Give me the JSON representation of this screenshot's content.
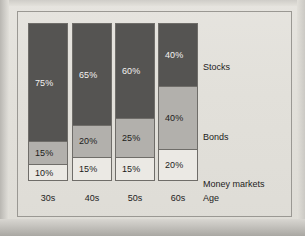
{
  "chart_data": {
    "type": "bar",
    "subtype": "stacked-100-percent",
    "title": "",
    "xlabel": "Age",
    "ylabel": "",
    "ylim": [
      0,
      100
    ],
    "grid": false,
    "legend_position": "right-inline",
    "categories": [
      "30s",
      "40s",
      "50s",
      "60s"
    ],
    "series": [
      {
        "name": "Stocks",
        "color": "#555452",
        "values": [
          75,
          65,
          60,
          40
        ]
      },
      {
        "name": "Bonds",
        "color": "#b2b0ac",
        "values": [
          15,
          20,
          25,
          40
        ]
      },
      {
        "name": "Money markets",
        "color": "#ebe9e4",
        "values": [
          10,
          15,
          15,
          20
        ]
      }
    ],
    "value_labels": [
      [
        "75%",
        "15%",
        "10%"
      ],
      [
        "65%",
        "20%",
        "15%"
      ],
      [
        "60%",
        "25%",
        "15%"
      ],
      [
        "40%",
        "40%",
        "20%"
      ]
    ],
    "annotations": []
  },
  "axis": {
    "title": "Age",
    "ticks": [
      "30s",
      "40s",
      "50s",
      "60s"
    ]
  },
  "legend": {
    "items": [
      {
        "label": "Stocks"
      },
      {
        "label": "Bonds"
      },
      {
        "label": "Money markets"
      }
    ]
  },
  "bars": [
    {
      "category": "30s",
      "segments": [
        {
          "series": "Stocks",
          "value": 75,
          "label": "75%"
        },
        {
          "series": "Bonds",
          "value": 15,
          "label": "15%"
        },
        {
          "series": "Money markets",
          "value": 10,
          "label": "10%"
        }
      ]
    },
    {
      "category": "40s",
      "segments": [
        {
          "series": "Stocks",
          "value": 65,
          "label": "65%"
        },
        {
          "series": "Bonds",
          "value": 20,
          "label": "20%"
        },
        {
          "series": "Money markets",
          "value": 15,
          "label": "15%"
        }
      ]
    },
    {
      "category": "50s",
      "segments": [
        {
          "series": "Stocks",
          "value": 60,
          "label": "60%"
        },
        {
          "series": "Bonds",
          "value": 25,
          "label": "25%"
        },
        {
          "series": "Money markets",
          "value": 15,
          "label": "15%"
        }
      ]
    },
    {
      "category": "60s",
      "segments": [
        {
          "series": "Stocks",
          "value": 40,
          "label": "40%"
        },
        {
          "series": "Bonds",
          "value": 40,
          "label": "40%"
        },
        {
          "series": "Money markets",
          "value": 20,
          "label": "20%"
        }
      ]
    }
  ],
  "colors": {
    "stocks": "#555452",
    "bonds": "#b2b0ac",
    "money_markets": "#ebe9e4",
    "frame": "#9a9893",
    "background": "#e2e0da",
    "text": "#1d1c1b"
  }
}
